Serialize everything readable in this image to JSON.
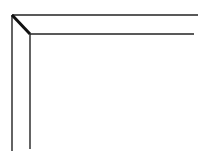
{
  "diagram": {
    "stroke_color": "#222222",
    "background": "#ffffff",
    "lines": {
      "outer_top": {
        "x1": 12,
        "y1": 15,
        "x2": 198,
        "y2": 15
      },
      "outer_left": {
        "x1": 12,
        "y1": 15,
        "x2": 12,
        "y2": 151
      },
      "miter": {
        "x1": 12,
        "y1": 15,
        "x2": 30,
        "y2": 34
      },
      "inner_top": {
        "x1": 30,
        "y1": 34,
        "x2": 194,
        "y2": 34
      },
      "inner_left": {
        "x1": 30,
        "y1": 34,
        "x2": 30,
        "y2": 149
      }
    }
  }
}
